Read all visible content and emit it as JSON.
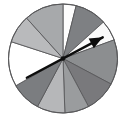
{
  "figure": {
    "name": "spinner-wheel",
    "background_color": "#ffffff",
    "outline_color": "#58585a",
    "outline_width": 1
  },
  "chart_data": {
    "type": "pie",
    "title": "",
    "subtitle": "",
    "xlabel": "",
    "ylabel": "",
    "grid": false,
    "legend": "none",
    "center": {
      "x": 63,
      "y": 58.5
    },
    "radius": 54.5,
    "units": "degrees",
    "angle_reference": "0 degrees = 12 o'clock, measured clockwise",
    "categories": [
      "sector-1",
      "sector-2",
      "sector-3",
      "sector-4",
      "sector-5",
      "sector-6",
      "sector-7",
      "sector-8",
      "sector-9",
      "sector-10",
      "sector-11"
    ],
    "values": [
      14,
      34,
      22,
      48,
      34,
      26,
      30,
      32,
      48,
      30,
      42
    ],
    "boundaries_deg": [
      0,
      14,
      48,
      70,
      118,
      152,
      178,
      208,
      240,
      288,
      318,
      360
    ],
    "sectors": [
      {
        "id": "sector-1",
        "label": "white",
        "start_deg": 0,
        "end_deg": 14,
        "sweep_deg": 14,
        "fill": "#fdfdfd"
      },
      {
        "id": "sector-2",
        "label": "dark-gray",
        "start_deg": 14,
        "end_deg": 48,
        "sweep_deg": 34,
        "fill": "#7e8083"
      },
      {
        "id": "sector-3",
        "label": "white",
        "start_deg": 48,
        "end_deg": 70,
        "sweep_deg": 22,
        "fill": "#fafafa"
      },
      {
        "id": "sector-4",
        "label": "medium-gray",
        "start_deg": 70,
        "end_deg": 118,
        "sweep_deg": 48,
        "fill": "#8c8e90"
      },
      {
        "id": "sector-5",
        "label": "dark-gray",
        "start_deg": 118,
        "end_deg": 152,
        "sweep_deg": 34,
        "fill": "#79797c"
      },
      {
        "id": "sector-6",
        "label": "medium-gray",
        "start_deg": 152,
        "end_deg": 178,
        "sweep_deg": 26,
        "fill": "#9a9c9e"
      },
      {
        "id": "sector-7",
        "label": "light-gray",
        "start_deg": 178,
        "end_deg": 208,
        "sweep_deg": 30,
        "fill": "#b6b7b9"
      },
      {
        "id": "sector-8",
        "label": "dark-gray",
        "start_deg": 208,
        "end_deg": 240,
        "sweep_deg": 32,
        "fill": "#7b7d80"
      },
      {
        "id": "sector-9",
        "label": "white",
        "start_deg": 240,
        "end_deg": 288,
        "sweep_deg": 48,
        "fill": "#ffffff"
      },
      {
        "id": "sector-10",
        "label": "light-gray",
        "start_deg": 288,
        "end_deg": 318,
        "sweep_deg": 30,
        "fill": "#b9babc"
      },
      {
        "id": "sector-11",
        "label": "medium-light-gray",
        "start_deg": 318,
        "end_deg": 360,
        "sweep_deg": 42,
        "fill": "#a7a9ab"
      }
    ],
    "pointer": {
      "id": "spinner-arrow",
      "color": "#0d0d0d",
      "head_angle_deg": 62,
      "head_length": 45,
      "tail_angle_deg": 242,
      "tail_length": 41,
      "head_width": 11
    }
  }
}
